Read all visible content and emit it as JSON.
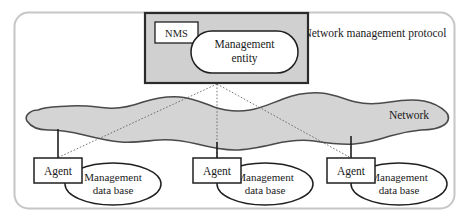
{
  "diagram": {
    "title_label": "Network management protocol",
    "network_label": "Network",
    "nms": {
      "tag_label": "NMS",
      "entity_label_line1": "Management",
      "entity_label_line2": "entity"
    },
    "agents": [
      {
        "name": "agent-left",
        "agent_label": "Agent",
        "db_label_line1": "Management",
        "db_label_line2": "data base"
      },
      {
        "name": "agent-middle",
        "agent_label": "Agent",
        "db_label_line1": "Management",
        "db_label_line2": "data base"
      },
      {
        "name": "agent-right",
        "agent_label": "Agent",
        "db_label_line1": "Management",
        "db_label_line2": "data base"
      }
    ],
    "colors": {
      "cloud_fill": "#d4d4d4",
      "cloud_stroke": "#4a4a4a",
      "nms_fill": "#d0d0d0",
      "nms_stroke": "#2b2b2b",
      "shape_fill": "#ffffff",
      "shape_stroke": "#1f1f1f",
      "container_stroke": "#c6c6c6",
      "connector_stroke": "#555555",
      "text": "#1a1a1a"
    }
  }
}
